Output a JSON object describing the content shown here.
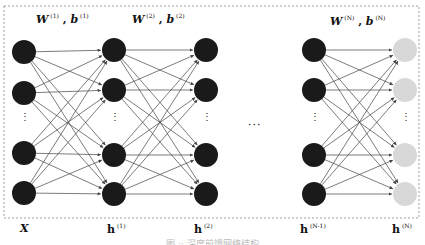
{
  "diagram": {
    "type": "feedforward-neural-network",
    "layers": [
      {
        "id": "input",
        "label": "X",
        "sup": "",
        "x": 24,
        "rows": [
          52,
          93,
          153,
          193
        ],
        "color": "#1a1a1a"
      },
      {
        "id": "h1",
        "label": "h",
        "sup": "(1)",
        "x": 114,
        "rows": [
          50,
          90,
          155,
          194
        ],
        "color": "#1a1a1a"
      },
      {
        "id": "h2",
        "label": "h",
        "sup": "(2)",
        "x": 206,
        "rows": [
          50,
          90,
          155,
          194
        ],
        "color": "#1a1a1a"
      },
      {
        "id": "hN-1",
        "label": "h",
        "sup": "(N-1)",
        "x": 314,
        "rows": [
          50,
          90,
          155,
          194
        ],
        "color": "#1a1a1a"
      },
      {
        "id": "hN",
        "label": "h",
        "sup": "(N)",
        "x": 405,
        "rows": [
          50,
          90,
          155,
          194
        ],
        "color": "#d8d8d8"
      }
    ],
    "node_radius": 12,
    "connections": [
      [
        "input",
        "h1"
      ],
      [
        "h1",
        "h2"
      ],
      [
        "hN-1",
        "hN"
      ]
    ],
    "weight_labels": [
      {
        "w": "W",
        "w_sup": "(1)",
        "b": "b",
        "b_sup": "(1)",
        "x": 45,
        "y": 14
      },
      {
        "w": "W",
        "w_sup": "(2)",
        "b": "b",
        "b_sup": "(2)",
        "x": 132,
        "y": 14
      },
      {
        "w": "W",
        "w_sup": "(N)",
        "b": "b",
        "b_sup": "(N)",
        "x": 330,
        "y": 14
      }
    ],
    "vertical_ellipsis": "⋮",
    "horizontal_ellipsis": "···",
    "frame": {
      "x": 4,
      "y": 6,
      "w": 415,
      "h": 212,
      "style": "dashed",
      "color": "#888888"
    },
    "caption": "图 ·· 深度前馈网络结构",
    "edge_color": "#444444"
  }
}
